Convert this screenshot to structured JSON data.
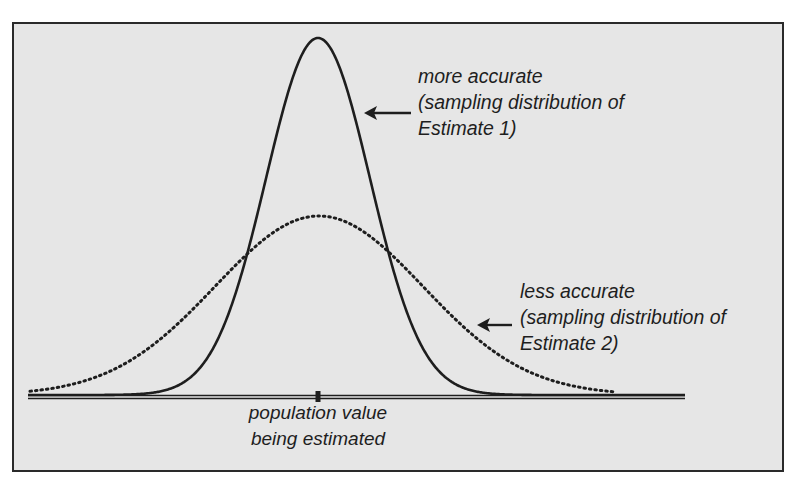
{
  "chart_data": {
    "type": "line",
    "title": "",
    "xlabel": "",
    "ylabel": "",
    "grid": false,
    "legend": "none",
    "axis": {
      "x_start_px": 28,
      "x_end_px": 685,
      "baseline_px": 397,
      "tick_x_px": 318
    },
    "series": [
      {
        "name": "Estimate 1 (more accurate)",
        "style": "solid",
        "mean_px": 318,
        "sigma_px": 52,
        "amplitude_px": 357
      },
      {
        "name": "Estimate 2 (less accurate)",
        "style": "dotted",
        "mean_px": 319,
        "sigma_px": 104,
        "amplitude_px": 179
      }
    ],
    "annotations": [
      {
        "lines": [
          "more accurate",
          "(sampling distribution of",
          "Estimate 1)"
        ],
        "arrow_to": "Estimate 1"
      },
      {
        "lines": [
          "less accurate",
          "(sampling distribution of",
          "Estimate 2)"
        ],
        "arrow_to": "Estimate 2"
      },
      {
        "lines": [
          "population value",
          "being estimated"
        ],
        "points_to": "tick"
      }
    ]
  },
  "labels": {
    "estimate1": {
      "line1": "more accurate",
      "line2": "(sampling distribution of",
      "line3": "Estimate 1)"
    },
    "estimate2": {
      "line1": "less accurate",
      "line2": "(sampling distribution of",
      "line3": "Estimate 2)"
    },
    "population": {
      "line1": "population value",
      "line2": "being estimated"
    }
  },
  "colors": {
    "background": "#e6e6e6",
    "ink": "#1e1e1e"
  }
}
